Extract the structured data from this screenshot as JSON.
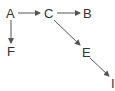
{
  "diagram": {
    "type": "directed-graph",
    "nodes": [
      {
        "id": "A",
        "label": "A",
        "x": 10,
        "y": 18
      },
      {
        "id": "C",
        "label": "C",
        "x": 48,
        "y": 18
      },
      {
        "id": "B",
        "label": "B",
        "x": 87,
        "y": 18
      },
      {
        "id": "F",
        "label": "F",
        "x": 10,
        "y": 55
      },
      {
        "id": "E",
        "label": "E",
        "x": 86,
        "y": 57
      },
      {
        "id": "I",
        "label": "I",
        "x": 113,
        "y": 87
      }
    ],
    "edges": [
      {
        "from": "A",
        "to": "C"
      },
      {
        "from": "C",
        "to": "B"
      },
      {
        "from": "A",
        "to": "F"
      },
      {
        "from": "C",
        "to": "E"
      },
      {
        "from": "E",
        "to": "I"
      }
    ],
    "colors": {
      "line": "#555555",
      "text": "#333333"
    }
  }
}
